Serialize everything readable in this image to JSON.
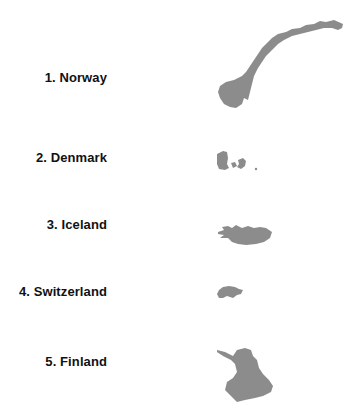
{
  "colors": {
    "text": "#111111",
    "silhouette": "#8c8c8c",
    "background": "#ffffff"
  },
  "items": [
    {
      "rank": 1,
      "label": "1. Norway",
      "country": "Norway",
      "icon": "norway-silhouette-icon"
    },
    {
      "rank": 2,
      "label": "2. Denmark",
      "country": "Denmark",
      "icon": "denmark-silhouette-icon"
    },
    {
      "rank": 3,
      "label": "3. Iceland",
      "country": "Iceland",
      "icon": "iceland-silhouette-icon"
    },
    {
      "rank": 4,
      "label": "4. Switzerland",
      "country": "Switzerland",
      "icon": "switzerland-silhouette-icon"
    },
    {
      "rank": 5,
      "label": "5. Finland",
      "country": "Finland",
      "icon": "finland-silhouette-icon"
    }
  ]
}
